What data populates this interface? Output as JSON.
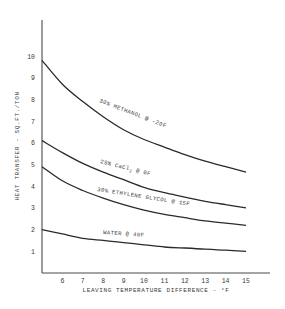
{
  "chart_data": {
    "type": "line",
    "title": "",
    "xlabel": "LEAVING TEMPERATURE DIFFERENCE - °F",
    "ylabel": "HEAT TRANSFER - SQ.FT./TON",
    "xlim": [
      5,
      16
    ],
    "ylim": [
      0,
      11
    ],
    "x_ticks": [
      6,
      7,
      8,
      9,
      10,
      11,
      12,
      13,
      14,
      15
    ],
    "y_ticks": [
      1,
      2,
      3,
      4,
      5,
      6,
      7,
      8,
      9,
      10
    ],
    "grid": false,
    "legend": "inline labels on curves",
    "x": [
      5,
      6,
      7,
      8,
      9,
      10,
      11,
      12,
      13,
      14,
      15
    ],
    "series": [
      {
        "name": "30% METHANOL @ -20F",
        "values": [
          9.8,
          8.7,
          7.9,
          7.2,
          6.6,
          6.15,
          5.8,
          5.45,
          5.15,
          4.9,
          4.65
        ]
      },
      {
        "name": "25% CaCl2 @ 0F",
        "values": [
          6.1,
          5.55,
          5.05,
          4.65,
          4.3,
          3.95,
          3.7,
          3.5,
          3.3,
          3.15,
          3.0
        ]
      },
      {
        "name": "30% ETHYLENE GLYCOL @ 15F",
        "values": [
          4.9,
          4.25,
          3.8,
          3.45,
          3.15,
          2.9,
          2.7,
          2.55,
          2.4,
          2.3,
          2.2
        ]
      },
      {
        "name": "WATER @ 40F",
        "values": [
          2.0,
          1.8,
          1.6,
          1.5,
          1.4,
          1.3,
          1.2,
          1.15,
          1.1,
          1.05,
          1.0
        ]
      }
    ]
  },
  "labels": {
    "methanol": "30% METHANOL @ -20F",
    "cacl_prefix": "25% CaCl",
    "cacl_sub": "2",
    "cacl_suffix": " @ 0F",
    "glycol": "30% ETHYLENE GLYCOL @ 15F",
    "water": "WATER @ 40F"
  },
  "colors": {
    "line": "#2a2a2a",
    "text": "#3a3a3a",
    "background": "#ffffff"
  }
}
